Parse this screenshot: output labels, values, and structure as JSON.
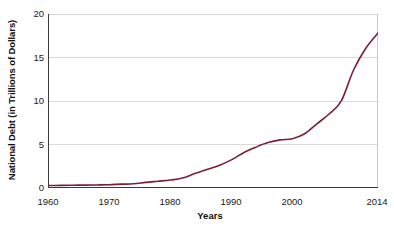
{
  "chart_data": {
    "type": "line",
    "title": "",
    "xlabel": "Years",
    "ylabel": "National Debt (in Trillions of Dollars)",
    "xlim": [
      1960,
      2014
    ],
    "ylim": [
      0,
      20
    ],
    "yticks": [
      0,
      5,
      10,
      15,
      20
    ],
    "xticks": [
      1960,
      1970,
      1980,
      1990,
      2000,
      2014
    ],
    "xtick_labels": [
      "1960",
      "1970",
      "1980",
      "1990",
      "2000",
      "2014"
    ],
    "ytick_labels": [
      "0",
      "5",
      "10",
      "15",
      "20"
    ],
    "x_minor_tick_step": 2,
    "grid": "horizontal",
    "legend": "none",
    "series": [
      {
        "name": "National Debt",
        "color": "#7a1f35",
        "line_width": 1.6,
        "x": [
          1960,
          1962,
          1964,
          1966,
          1968,
          1970,
          1972,
          1974,
          1976,
          1978,
          1980,
          1982,
          1984,
          1986,
          1988,
          1990,
          1992,
          1994,
          1996,
          1998,
          2000,
          2002,
          2004,
          2006,
          2008,
          2010,
          2012,
          2014
        ],
        "values": [
          0.29,
          0.3,
          0.32,
          0.33,
          0.35,
          0.38,
          0.44,
          0.48,
          0.65,
          0.78,
          0.91,
          1.14,
          1.66,
          2.13,
          2.6,
          3.23,
          4.06,
          4.69,
          5.22,
          5.53,
          5.67,
          6.23,
          7.38,
          8.51,
          10.02,
          13.56,
          16.07,
          17.82
        ]
      }
    ],
    "annotations": []
  },
  "axis": {
    "ylabel": "National Debt (in Trillions of Dollars)",
    "xlabel": "Years"
  }
}
